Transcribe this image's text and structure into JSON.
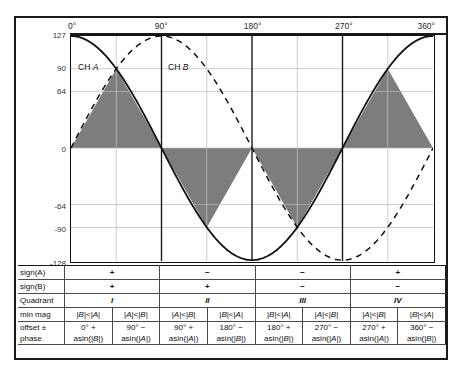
{
  "chart_data": {
    "type": "line",
    "title": "",
    "xlabel": "",
    "ylabel": "ADC Level",
    "xlim": [
      0,
      360
    ],
    "ylim": [
      -128,
      127
    ],
    "grid": true,
    "legend_position": "inline",
    "x_ticks": [
      {
        "value": 0,
        "label": "0°"
      },
      {
        "value": 90,
        "label": "90°"
      },
      {
        "value": 180,
        "label": "180°"
      },
      {
        "value": 270,
        "label": "270°"
      },
      {
        "value": 360,
        "label": "360°"
      }
    ],
    "y_ticks": [
      {
        "value": 127,
        "label": "127"
      },
      {
        "value": 90,
        "label": "90"
      },
      {
        "value": 64,
        "label": "64"
      },
      {
        "value": 0,
        "label": "0"
      },
      {
        "value": -64,
        "label": "-64"
      },
      {
        "value": -90,
        "label": "-90"
      },
      {
        "value": -128,
        "label": "-128"
      }
    ],
    "gridlines_x": [
      45,
      90,
      135,
      180,
      225,
      270,
      315
    ],
    "quadrant_dividers": [
      90,
      180,
      270
    ],
    "series": [
      {
        "name": "CH A",
        "style": "solid",
        "color": "#111111",
        "function": "cos",
        "amplitude": 127,
        "phase_deg": 0,
        "label_x": 8,
        "label_y": 97
      },
      {
        "name": "CH B",
        "style": "dashed",
        "color": "#111111",
        "function": "sin",
        "amplitude": 127,
        "phase_deg": 0,
        "label_x": 98,
        "label_y": 97
      }
    ],
    "shaded_regions": {
      "color": "#7d7d7d",
      "description": "triangular min-magnitude envelope",
      "segments": [
        {
          "x0": 0,
          "x1": 45,
          "y0": 0,
          "y1": 90
        },
        {
          "x0": 45,
          "x1": 90,
          "y0": 90,
          "y1": 0
        },
        {
          "x0": 90,
          "x1": 135,
          "y0": 0,
          "y1": -90
        },
        {
          "x0": 135,
          "x1": 180,
          "y0": -90,
          "y1": 0
        },
        {
          "x0": 180,
          "x1": 225,
          "y0": 0,
          "y1": -90
        },
        {
          "x0": 225,
          "x1": 270,
          "y0": -90,
          "y1": 0
        },
        {
          "x0": 270,
          "x1": 315,
          "y0": 0,
          "y1": 90
        },
        {
          "x0": 315,
          "x1": 360,
          "y0": 90,
          "y1": 0
        }
      ]
    }
  },
  "table": {
    "row_labels": {
      "sign_a": "sign(A)",
      "sign_b": "sign(B)",
      "quadrant": "Quadrant",
      "min_mag": "min mag",
      "offset_phase_l1": "offset ±",
      "offset_phase_l2": "phase"
    },
    "sign_a": [
      "+",
      "−",
      "−",
      "+"
    ],
    "sign_b": [
      "+",
      "+",
      "−",
      "−"
    ],
    "quadrant": [
      "I",
      "II",
      "III",
      "IV"
    ],
    "min_mag": [
      "|B|<|A|",
      "|A|<|B|",
      "|A|<|B|",
      "|B|<|A|",
      "|B|<|A|",
      "|A|<|B|",
      "|A|<|B|",
      "|B|<|A|"
    ],
    "offset": [
      "0° +",
      "90° −",
      "90° +",
      "180° −",
      "180° +",
      "270° −",
      "270° +",
      "360° −"
    ],
    "phase": [
      "asin(|B|)",
      "asin(|A|)",
      "asin(|A|)",
      "asin(|B|)",
      "asin(|B|)",
      "asin(|A|)",
      "asin(|A|)",
      "asin(|B|)"
    ]
  }
}
